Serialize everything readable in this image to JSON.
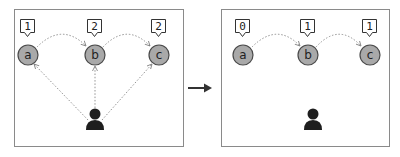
{
  "diagram": {
    "type": "before-after graph transformation",
    "transition_arrow": "right-arrow",
    "panels": [
      {
        "id": "before",
        "nodes": [
          {
            "label": "a",
            "count": "1"
          },
          {
            "label": "b",
            "count": "2"
          },
          {
            "label": "c",
            "count": "2"
          }
        ],
        "edges": [
          {
            "from": "a",
            "to": "b"
          },
          {
            "from": "b",
            "to": "c"
          },
          {
            "from": "user",
            "to": "a"
          },
          {
            "from": "user",
            "to": "b"
          },
          {
            "from": "user",
            "to": "c"
          }
        ],
        "actor": "user-icon"
      },
      {
        "id": "after",
        "nodes": [
          {
            "label": "a",
            "count": "0"
          },
          {
            "label": "b",
            "count": "1"
          },
          {
            "label": "c",
            "count": "1"
          }
        ],
        "edges": [
          {
            "from": "a",
            "to": "b"
          },
          {
            "from": "b",
            "to": "c"
          }
        ],
        "actor": "user-icon"
      }
    ]
  },
  "colors": {
    "node_fill": "#a9a9a9",
    "node_stroke": "#4a4a4a",
    "edge": "#888888",
    "person": "#1e1e1e",
    "panel_border": "#8a8a8a"
  }
}
